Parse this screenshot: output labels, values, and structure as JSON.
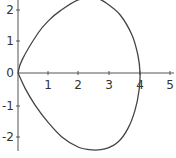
{
  "chart_data": {
    "type": "line",
    "title": "",
    "xlabel": "",
    "ylabel": "",
    "xlim": [
      0,
      5.1
    ],
    "ylim": [
      -2.5,
      2.3
    ],
    "grid": false,
    "legend": null,
    "x_ticks": [
      "1",
      "2",
      "3",
      "4",
      "5"
    ],
    "y_ticks": [
      "2",
      "1",
      "0",
      "-1",
      "-2"
    ],
    "series": [
      {
        "name": "closed curve",
        "description": "teardrop-shaped closed curve through the origin and (4,0), symmetric about the x-axis",
        "x": [
          0,
          0.13,
          0.66,
          1.02,
          1.38,
          1.97,
          2.52,
          2.85,
          3.35,
          3.74,
          3.93,
          4.0,
          3.97,
          3.84,
          3.61,
          3.28,
          2.85,
          2.43,
          1.97,
          1.44,
          0.98,
          0.56,
          0.23,
          0
        ],
        "y": [
          0,
          0.41,
          1.27,
          1.68,
          1.97,
          2.32,
          2.38,
          2.25,
          1.84,
          1.2,
          0.57,
          0,
          -0.54,
          -1.17,
          -1.75,
          -2.19,
          -2.41,
          -2.44,
          -2.35,
          -2.03,
          -1.56,
          -1.02,
          -0.48,
          0
        ]
      }
    ]
  },
  "labels": {
    "x_tick_1": "1",
    "x_tick_2": "2",
    "x_tick_3": "3",
    "x_tick_4": "4",
    "x_tick_5": "5",
    "y_tick_2": "2",
    "y_tick_1": "1",
    "y_tick_0": "0",
    "y_tick_m1": "-1",
    "y_tick_m2": "-2"
  }
}
